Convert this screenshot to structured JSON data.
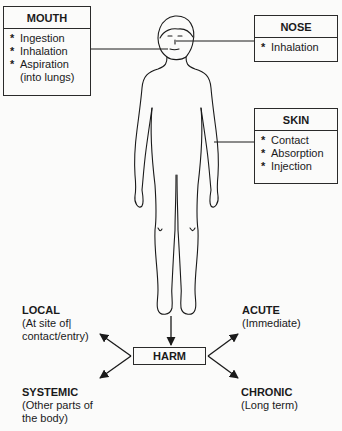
{
  "routes": {
    "mouth": {
      "title": "MOUTH",
      "items": [
        "Ingestion",
        "Inhalation",
        "Aspiration",
        "(into lungs)"
      ],
      "bullets": [
        "*",
        "*",
        "*",
        ""
      ]
    },
    "nose": {
      "title": "NOSE",
      "items": [
        "Inhalation"
      ],
      "bullets": [
        "*"
      ]
    },
    "skin": {
      "title": "SKIN",
      "items": [
        "Contact",
        "Absorption",
        "Injection"
      ],
      "bullets": [
        "*",
        "*",
        "*"
      ]
    }
  },
  "center": {
    "label": "HARM"
  },
  "effects": {
    "local": {
      "title": "LOCAL",
      "lines": [
        "(At site of|",
        "contact/entry)"
      ]
    },
    "systemic": {
      "title": "SYSTEMIC",
      "lines": [
        "(Other parts of",
        "the body)"
      ]
    },
    "acute": {
      "title": "ACUTE",
      "lines": [
        "(Immediate)"
      ]
    },
    "chronic": {
      "title": "CHRONIC",
      "lines": [
        "(Long term)"
      ]
    }
  },
  "figure": {
    "icon": "human-body-outline"
  }
}
